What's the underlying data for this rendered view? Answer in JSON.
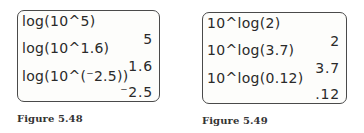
{
  "figures": [
    {
      "caption": "Figure 5.48",
      "rows": [
        {
          "entry": "log(10^5)",
          "result": "5"
        },
        {
          "entry": "log(10^1.6)",
          "result": "1.6"
        },
        {
          "entry": "log(10^(⁻2.5))",
          "result": "⁻2.5"
        }
      ]
    },
    {
      "caption": "Figure 5.49",
      "rows": [
        {
          "entry": "10^log(2)",
          "result": "2"
        },
        {
          "entry": "10^log(3.7)",
          "result": "3.7"
        },
        {
          "entry": "10^log(0.12)",
          "result": ".12"
        }
      ]
    }
  ]
}
